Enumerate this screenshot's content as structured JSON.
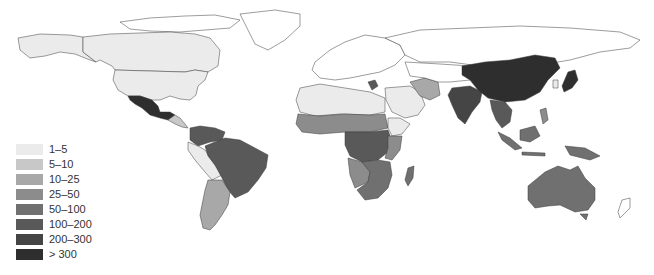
{
  "legend": {
    "items": [
      {
        "label": "1–5",
        "color": "#ebebeb"
      },
      {
        "label": "5–10",
        "color": "#c8c8c8"
      },
      {
        "label": "10–25",
        "color": "#a8a8a8"
      },
      {
        "label": "25–50",
        "color": "#8c8c8c"
      },
      {
        "label": "50–100",
        "color": "#707070"
      },
      {
        "label": "100–200",
        "color": "#595959"
      },
      {
        "label": "200–300",
        "color": "#454545"
      },
      {
        "label": "> 300",
        "color": "#2e2e2e"
      }
    ]
  },
  "regions": [
    {
      "name": "Alaska/USA",
      "class": "1–5"
    },
    {
      "name": "Canada",
      "class": "none"
    },
    {
      "name": "Mexico",
      "class": "> 300"
    },
    {
      "name": "Brazil",
      "class": "100–200"
    },
    {
      "name": "Colombia/Venezuela",
      "class": "100–200"
    },
    {
      "name": "Argentina",
      "class": "10–25"
    },
    {
      "name": "Europe",
      "class": "none"
    },
    {
      "name": "North Africa",
      "class": "1–5"
    },
    {
      "name": "Central Africa",
      "class": "100–200"
    },
    {
      "name": "Southern Africa",
      "class": "50–100"
    },
    {
      "name": "Madagascar",
      "class": "50–100"
    },
    {
      "name": "Iran",
      "class": "10–25"
    },
    {
      "name": "India",
      "class": "100–200"
    },
    {
      "name": "China",
      "class": "> 300"
    },
    {
      "name": "Japan",
      "class": "> 300"
    },
    {
      "name": "Southeast Asia",
      "class": "100–200"
    },
    {
      "name": "Indonesia",
      "class": "50–100"
    },
    {
      "name": "Australia",
      "class": "50–100"
    }
  ]
}
